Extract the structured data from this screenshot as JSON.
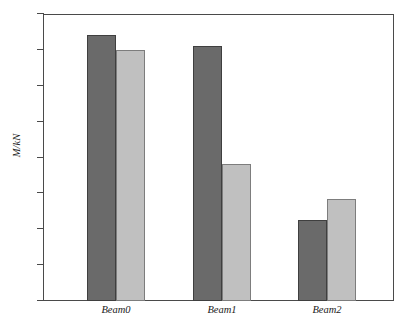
{
  "chart_data": {
    "type": "bar",
    "title": "",
    "xlabel": "",
    "ylabel": "M/kN",
    "categories": [
      "Beam0",
      "Beam1",
      "Beam2"
    ],
    "series": [
      {
        "name": "series-1",
        "color": "#6a6a6a",
        "values": [
          14.85,
          14.2,
          4.5
        ]
      },
      {
        "name": "series-2",
        "color": "#c0c0c0",
        "values": [
          14.0,
          7.65,
          5.7
        ]
      }
    ],
    "ylim": [
      0,
      16
    ],
    "yticks": [
      0,
      2,
      4,
      6,
      8,
      10,
      12,
      14,
      16
    ],
    "ytick_labels": [
      "0",
      "2",
      "4",
      "6",
      "8",
      "10",
      "12",
      "14",
      "16"
    ],
    "grid": false,
    "legend": "none"
  }
}
